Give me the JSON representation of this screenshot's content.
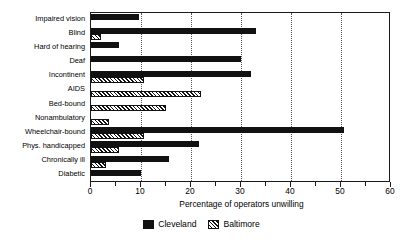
{
  "chart_data": {
    "type": "bar",
    "orientation": "horizontal",
    "title": "",
    "xlabel": "Percentage of operators unwilling",
    "ylabel": "",
    "xlim": [
      0,
      60
    ],
    "xticks": [
      0,
      10,
      20,
      30,
      40,
      50,
      60
    ],
    "xtick_labels": [
      "0",
      "10",
      "20",
      "30",
      "40",
      "50",
      "60"
    ],
    "grid": "vertical-dotted-at-major-ticks",
    "legend_position": "bottom-center",
    "categories": [
      "Impaired vision",
      "Blind",
      "Hard of hearing",
      "Deaf",
      "Incontinent",
      "AIDS",
      "Bed-bound",
      "Nonambulatory",
      "Wheelchair-bound",
      "Phys. handicapped",
      "Chronically ill",
      "Diabetic"
    ],
    "series": [
      {
        "name": "Cleveland",
        "color": "#111111",
        "pattern": "solid",
        "values": [
          9.5,
          33.0,
          5.5,
          30.0,
          32.0,
          0,
          0,
          0,
          50.5,
          21.5,
          15.5,
          10.0
        ]
      },
      {
        "name": "Baltimore",
        "color": "#111111",
        "pattern": "diagonal-hatch",
        "values": [
          0,
          2.0,
          0,
          0,
          10.5,
          22.0,
          15.0,
          3.5,
          10.5,
          5.5,
          3.0,
          0
        ]
      }
    ]
  },
  "legend": {
    "items": [
      {
        "label": "Cleveland",
        "swatch": "solid-black-square-icon"
      },
      {
        "label": "Baltimore",
        "swatch": "hatched-square-icon"
      }
    ]
  }
}
